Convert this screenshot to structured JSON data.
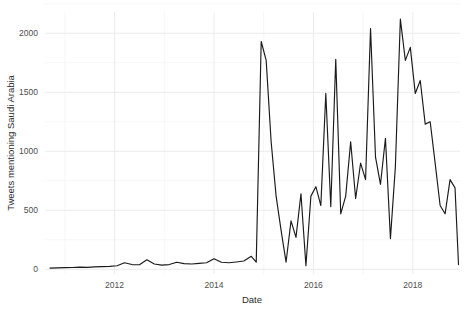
{
  "chart_data": {
    "type": "line",
    "title": "",
    "xlabel": "Date",
    "ylabel": "Tweets mentioning Saudi Arabia",
    "xlim": [
      2010.6,
      2018.95
    ],
    "ylim": [
      -40,
      2180
    ],
    "grid": true,
    "legend": false,
    "legend_position": "none",
    "line_color": "#1a1a1a",
    "background_color": "#ffffff",
    "gridline_color": "#e9e9e9",
    "x_tick_labels": [
      "2012",
      "2014",
      "2016",
      "2018"
    ],
    "x_tick_values": [
      2012,
      2014,
      2016,
      2018
    ],
    "y_tick_labels": [
      "0",
      "500",
      "1000",
      "1500",
      "2000"
    ],
    "y_tick_values": [
      0,
      500,
      1000,
      1500,
      2000
    ],
    "series": [
      {
        "name": "Tweets mentioning Saudi Arabia",
        "x": [
          2010.7,
          2010.85,
          2011.0,
          2011.15,
          2011.3,
          2011.45,
          2011.6,
          2011.75,
          2011.9,
          2012.05,
          2012.2,
          2012.35,
          2012.5,
          2012.65,
          2012.8,
          2012.95,
          2013.1,
          2013.25,
          2013.4,
          2013.55,
          2013.7,
          2013.85,
          2014.0,
          2014.15,
          2014.3,
          2014.45,
          2014.6,
          2014.75,
          2014.85,
          2014.95,
          2015.05,
          2015.15,
          2015.25,
          2015.35,
          2015.45,
          2015.55,
          2015.65,
          2015.75,
          2015.85,
          2015.95,
          2016.05,
          2016.15,
          2016.25,
          2016.35,
          2016.45,
          2016.55,
          2016.65,
          2016.75,
          2016.85,
          2016.95,
          2017.05,
          2017.15,
          2017.25,
          2017.35,
          2017.45,
          2017.55,
          2017.65,
          2017.75,
          2017.85,
          2017.95,
          2018.05,
          2018.15,
          2018.25,
          2018.35,
          2018.45,
          2018.55,
          2018.65,
          2018.75,
          2018.85,
          2018.92
        ],
        "values": [
          10,
          12,
          14,
          15,
          18,
          16,
          20,
          22,
          25,
          30,
          55,
          40,
          38,
          80,
          45,
          35,
          40,
          60,
          48,
          45,
          50,
          55,
          90,
          60,
          55,
          62,
          70,
          110,
          60,
          1930,
          1770,
          1080,
          620,
          330,
          60,
          410,
          270,
          640,
          30,
          620,
          700,
          540,
          1490,
          530,
          1780,
          470,
          620,
          1080,
          600,
          900,
          760,
          2040,
          950,
          720,
          1110,
          260,
          870,
          2120,
          1770,
          1880,
          1490,
          1600,
          1230,
          1250,
          900,
          540,
          470,
          760,
          690,
          40
        ]
      }
    ]
  },
  "axes": {
    "x_title": "Date",
    "y_title": "Tweets mentioning Saudi Arabia"
  }
}
